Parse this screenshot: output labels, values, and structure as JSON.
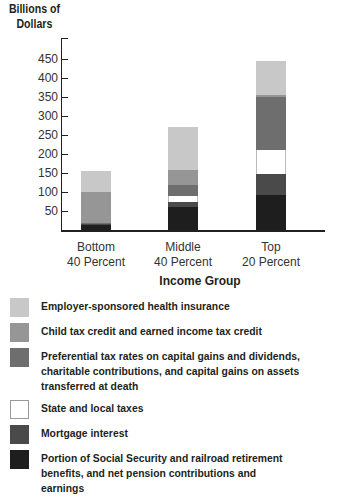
{
  "chart_data": {
    "type": "bar",
    "stacked": true,
    "title": "",
    "xlabel": "Income Group",
    "ylabel": "Billions of Dollars",
    "ylim": [
      0,
      480
    ],
    "yticks": [
      50,
      100,
      150,
      200,
      250,
      300,
      350,
      400,
      450
    ],
    "grid": false,
    "legend_position": "bottom",
    "categories": [
      "Bottom 40 Percent",
      "Middle 40 Percent",
      "Top 20 Percent"
    ],
    "series": [
      {
        "name": "Portion of Social Security and railroad retirement benefits, and net pension contributions and earnings",
        "color": "#1e1e1e",
        "values": [
          13,
          60,
          92
        ]
      },
      {
        "name": "Mortgage interest",
        "color": "#4a4a4a",
        "values": [
          4,
          14,
          55
        ]
      },
      {
        "name": "State and local taxes",
        "color": "#ffffff",
        "values": [
          0,
          16,
          63
        ]
      },
      {
        "name": "Preferential tax rates on capital gains and dividends, charitable contributions, and capital gains on assets transferred at death",
        "color": "#6e6e6e",
        "values": [
          1,
          28,
          140
        ]
      },
      {
        "name": "Child tax credit and earned income tax credit",
        "color": "#969696",
        "values": [
          82,
          40,
          5
        ]
      },
      {
        "name": "Employer-sponsored health insurance",
        "color": "#c8c8c8",
        "values": [
          55,
          113,
          90
        ]
      }
    ],
    "totals": [
      155,
      271,
      445
    ]
  },
  "axis": {
    "ylabel_line1": "Billions of",
    "ylabel_line2": "Dollars",
    "yticks": [
      "450",
      "400",
      "350",
      "300",
      "250",
      "200",
      "150",
      "100",
      "50"
    ],
    "xcats": [
      {
        "line1": "Bottom",
        "line2": "40 Percent"
      },
      {
        "line1": "Middle",
        "line2": "40 Percent"
      },
      {
        "line1": "Top",
        "line2": "20 Percent"
      }
    ],
    "xtitle": "Income Group"
  },
  "legend": [
    {
      "label": "Employer-sponsored health insurance",
      "color": "#c8c8c8"
    },
    {
      "label": "Child tax credit and earned income tax credit",
      "color": "#969696"
    },
    {
      "label": "Preferential tax rates on capital gains and dividends, charitable contributions, and capital gains on assets transferred at death",
      "color": "#6e6e6e"
    },
    {
      "label": "State and local taxes",
      "color": "#ffffff"
    },
    {
      "label": "Mortgage interest",
      "color": "#4a4a4a"
    },
    {
      "label": "Portion of Social Security and railroad retirement benefits, and net pension contributions and earnings",
      "color": "#1e1e1e"
    }
  ]
}
